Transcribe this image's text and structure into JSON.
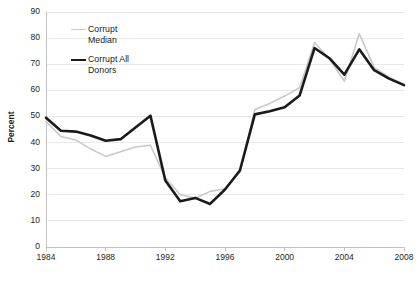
{
  "chart_data": {
    "type": "line",
    "title": "",
    "xlabel": "",
    "ylabel": "Percent",
    "xlim": [
      1984,
      2008
    ],
    "ylim": [
      0,
      90
    ],
    "yticks": [
      0,
      10,
      20,
      30,
      40,
      50,
      60,
      70,
      80,
      90
    ],
    "xticks": [
      1984,
      1988,
      1992,
      1996,
      2000,
      2004,
      2008
    ],
    "grid": true,
    "grid_axis": "y",
    "legend_position": "upper-left-inside",
    "x": [
      1984,
      1985,
      1986,
      1987,
      1988,
      1989,
      1990,
      1991,
      1992,
      1993,
      1994,
      1995,
      1996,
      1997,
      1998,
      1999,
      2000,
      2001,
      2002,
      2003,
      2004,
      2005,
      2006,
      2007,
      2008
    ],
    "series": [
      {
        "name": "Corrupt Median",
        "color": "#c9c9c9",
        "width": 1.6,
        "values": [
          48.0,
          42.3,
          41.0,
          37.5,
          34.7,
          36.5,
          38.3,
          39.0,
          26.5,
          20.0,
          18.7,
          21.3,
          22.3,
          28.8,
          52.7,
          55.0,
          57.8,
          61.0,
          78.3,
          72.0,
          63.5,
          81.7,
          68.8,
          65.0,
          62.3
        ]
      },
      {
        "name": "Corrupt All Donors",
        "color": "#1a1a1a",
        "width": 2.6,
        "values": [
          49.5,
          44.5,
          44.2,
          42.7,
          40.7,
          41.3,
          45.8,
          50.3,
          25.5,
          17.5,
          18.8,
          16.5,
          22.0,
          29.3,
          50.8,
          52.0,
          53.5,
          58.0,
          76.2,
          72.3,
          66.0,
          75.7,
          67.7,
          64.5,
          62.0
        ]
      }
    ]
  },
  "axis": {
    "y_title": "Percent",
    "y_tick_labels": [
      "90",
      "80",
      "70",
      "60",
      "50",
      "40",
      "30",
      "20",
      "10",
      "0"
    ],
    "x_tick_labels": [
      "1984",
      "1988",
      "1992",
      "1996",
      "2000",
      "2004",
      "2008"
    ]
  },
  "legend": {
    "items": [
      {
        "line1": "Corrupt",
        "line2": "Median"
      },
      {
        "line1": "Corrupt All",
        "line2": "Donors"
      }
    ]
  }
}
